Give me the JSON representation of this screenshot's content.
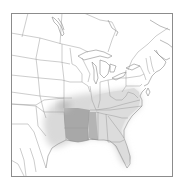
{
  "map": {
    "type": "species-range-map",
    "region": "Eastern United States",
    "colors": {
      "background": "#ffffff",
      "frame": "#8c8c8c",
      "borders": "#9a9a9a",
      "range_core": "#a6a6a6",
      "range_extended": "#d8d8d8"
    },
    "legend": [
      {
        "name": "core-range",
        "color": "#a6a6a6",
        "states": [
          "Arkansas",
          "Louisiana",
          "Mississippi",
          "Western Tennessee"
        ]
      },
      {
        "name": "extended-range",
        "color": "#d8d8d8",
        "states": [
          "East Texas",
          "Eastern Oklahoma",
          "Kentucky",
          "Tennessee",
          "Alabama",
          "Georgia",
          "Florida",
          "South Carolina",
          "North Carolina",
          "Virginia",
          "Southern Missouri"
        ]
      }
    ]
  }
}
